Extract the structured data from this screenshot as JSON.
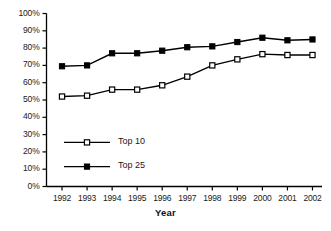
{
  "chart_data": {
    "type": "line",
    "title": "",
    "xlabel": "Year",
    "ylabel": "",
    "categories": [
      "1992",
      "1993",
      "1994",
      "1995",
      "1996",
      "1997",
      "1998",
      "1999",
      "2000",
      "2001",
      "2002"
    ],
    "series": [
      {
        "name": "Top 10",
        "marker": "open-square",
        "color": "#000000",
        "values": [
          52,
          52.5,
          56,
          56,
          58.5,
          63.5,
          70,
          73.5,
          76.5,
          76,
          76
        ]
      },
      {
        "name": "Top 25",
        "marker": "filled-square",
        "color": "#000000",
        "values": [
          69.5,
          70,
          77,
          77,
          78.5,
          80.5,
          81,
          83.5,
          86,
          84.5,
          85
        ]
      }
    ],
    "ylim": [
      0,
      100
    ],
    "ytick_labels": [
      "0%",
      "10%",
      "20%",
      "30%",
      "40%",
      "50%",
      "60%",
      "70%",
      "80%",
      "90%",
      "100%"
    ],
    "ytick_values": [
      0,
      10,
      20,
      30,
      40,
      50,
      60,
      70,
      80,
      90,
      100
    ],
    "grid": false,
    "legend_position": "inside-lower-left",
    "axis_color": "#000000",
    "background": "#ffffff"
  },
  "legend": {
    "entries": [
      {
        "label": "Top 10"
      },
      {
        "label": "Top 25"
      }
    ]
  },
  "axis": {
    "x_title": "Year"
  }
}
